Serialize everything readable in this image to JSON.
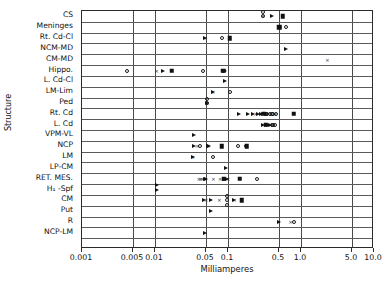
{
  "chart_data": {
    "type": "scatter",
    "title": "",
    "xlabel": "Milliamperes",
    "ylabel": "Structure",
    "xscale": "log",
    "xlim": [
      0.001,
      10.0
    ],
    "grid": true,
    "legend": "none",
    "xticks": [
      {
        "value": 0.001,
        "label": "0.001"
      },
      {
        "value": 0.005,
        "label": "0.005"
      },
      {
        "value": 0.01,
        "label": "0.01"
      },
      {
        "value": 0.05,
        "label": "0.05"
      },
      {
        "value": 0.1,
        "label": "0.1"
      },
      {
        "value": 0.5,
        "label": "0.5"
      },
      {
        "value": 1.0,
        "label": "1.0"
      },
      {
        "value": 5.0,
        "label": "5.0"
      },
      {
        "value": 10.0,
        "label": "10.0"
      }
    ],
    "categories": [
      "CS",
      "Meninges",
      "Rt. Cd-Cl",
      "NCM-MD",
      "CM-MD",
      "Hippo.",
      "L. Cd-Cl",
      "LM-Lim",
      "Ped",
      "Rt. Cd",
      "L. Cd",
      "VPM-VL",
      "NCP",
      "LM",
      "LP-CM",
      "RET. MES.",
      "H₁ -Spf",
      "CM",
      "Put",
      "R",
      "NCP-LM"
    ],
    "marker_types": [
      "circle",
      "triangle",
      "square",
      "x"
    ],
    "points": [
      {
        "category": "CS",
        "values_circle": [
          0.3,
          0.3
        ],
        "values_x": [
          0.3
        ],
        "values_triangle": [
          0.4
        ],
        "values_square": [
          0.56
        ]
      },
      {
        "category": "Meninges",
        "values_circle": [
          0.62
        ],
        "values_triangle": [
          0.5,
          0.52
        ],
        "values_square": [
          0.5
        ],
        "values_x": []
      },
      {
        "category": "Rt. Cd-Cl",
        "values_circle": [
          0.082
        ],
        "values_triangle": [
          0.048
        ],
        "values_square": [
          0.105
        ],
        "values_x": [
          0.048
        ]
      },
      {
        "category": "NCM-MD",
        "values_circle": [],
        "values_triangle": [
          0.62
        ],
        "values_square": [],
        "values_x": []
      },
      {
        "category": "CM-MD",
        "values_circle": [],
        "values_triangle": [],
        "values_square": [],
        "values_x": [
          2.3
        ]
      },
      {
        "category": "Hippo.",
        "values_circle": [
          0.0042,
          0.046
        ],
        "values_triangle": [
          0.013,
          0.088,
          0.092
        ],
        "values_square": [
          0.017,
          0.086
        ],
        "values_x": [
          0.0105,
          0.088
        ]
      },
      {
        "category": "L. Cd-Cl",
        "values_circle": [],
        "values_triangle": [
          0.092
        ],
        "values_square": [],
        "values_x": []
      },
      {
        "category": "LM-Lim",
        "values_circle": [
          0.105
        ],
        "values_triangle": [
          0.062
        ],
        "values_square": [],
        "values_x": [
          0.062
        ]
      },
      {
        "category": "Ped",
        "values_circle": [
          0.052,
          0.052
        ],
        "values_triangle": [
          0.052
        ],
        "values_square": [],
        "values_x": [
          0.052
        ]
      },
      {
        "category": "Rt. Cd",
        "values_circle": [
          0.34,
          0.38,
          0.42,
          0.46,
          0.33,
          0.4
        ],
        "values_triangle": [
          0.14,
          0.19,
          0.22,
          0.26,
          0.3,
          0.33,
          0.28
        ],
        "values_square": [
          0.31,
          0.8
        ],
        "values_x": [
          0.24,
          0.36,
          0.44
        ]
      },
      {
        "category": "L. Cd",
        "values_circle": [
          0.4,
          0.44,
          0.42
        ],
        "values_triangle": [
          0.3,
          0.35,
          0.38,
          0.33
        ],
        "values_square": [
          0.33
        ],
        "values_x": [
          0.36,
          0.41
        ]
      },
      {
        "category": "VPM-VL",
        "values_circle": [],
        "values_triangle": [
          0.034
        ],
        "values_square": [],
        "values_x": []
      },
      {
        "category": "NCP",
        "values_circle": [
          0.042,
          0.135,
          0.175
        ],
        "values_triangle": [
          0.034,
          0.053,
          0.055
        ],
        "values_square": [
          0.082,
          0.18
        ],
        "values_x": [
          0.038,
          0.053
        ]
      },
      {
        "category": "LM",
        "values_circle": [
          0.062
        ],
        "values_triangle": [
          0.033
        ],
        "values_square": [],
        "values_x": [
          0.033
        ]
      },
      {
        "category": "LP-CM",
        "values_circle": [],
        "values_triangle": [
          0.093
        ],
        "values_square": [],
        "values_x": []
      },
      {
        "category": "RET. MES.",
        "values_circle": [
          0.25
        ],
        "values_triangle": [
          0.048,
          0.05,
          0.088,
          0.09,
          0.095,
          0.098
        ],
        "values_square": [
          0.088,
          0.145
        ],
        "values_x": [
          0.04,
          0.042,
          0.044,
          0.063,
          0.078,
          0.1
        ]
      },
      {
        "category": "H₁ -Spf",
        "values_circle": [],
        "values_triangle": [
          0.0105,
          0.0105
        ],
        "values_square": [],
        "values_x": []
      },
      {
        "category": "CM",
        "values_circle": [
          0.098,
          0.098,
          0.098
        ],
        "values_triangle": [
          0.047,
          0.059,
          0.122
        ],
        "values_square": [
          0.155
        ],
        "values_x": [
          0.05,
          0.076,
          0.122
        ]
      },
      {
        "category": "Put",
        "values_circle": [],
        "values_triangle": [
          0.058
        ],
        "values_square": [],
        "values_x": []
      },
      {
        "category": "R",
        "values_circle": [
          0.8
        ],
        "values_triangle": [
          0.5
        ],
        "values_square": [],
        "values_x": [
          0.72
        ]
      },
      {
        "category": "NCP-LM",
        "values_circle": [],
        "values_triangle": [
          0.048
        ],
        "values_square": [],
        "values_x": []
      }
    ]
  },
  "axes": {
    "x_title": "Milliamperes",
    "y_title": "Structure"
  }
}
